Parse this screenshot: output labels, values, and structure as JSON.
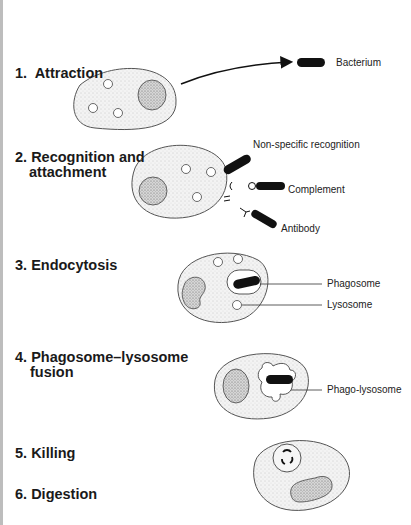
{
  "diagram": {
    "steps": [
      {
        "number": "1.",
        "title": "Attraction"
      },
      {
        "number": "2.",
        "title": "Recognition and",
        "title2": "attachment"
      },
      {
        "number": "3.",
        "title": "Endocytosis"
      },
      {
        "number": "4.",
        "title": "Phagosome–lysosome",
        "title2": "fusion"
      },
      {
        "number": "5.",
        "title": "Killing"
      },
      {
        "number": "6.",
        "title": "Digestion"
      }
    ],
    "labels": {
      "bacterium": "Bacterium",
      "nonspecific": "Non-specific recognition",
      "complement": "Complement",
      "antibody": "Antibody",
      "phagosome": "Phagosome",
      "lysosome": "Lysosome",
      "phagolysosome": "Phago-lysosome"
    }
  }
}
